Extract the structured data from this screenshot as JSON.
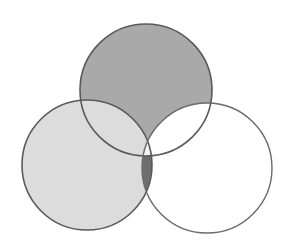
{
  "diagram": {
    "type": "venn",
    "set_count": 3,
    "background": "#ffffff",
    "stroke_color": "#5a5a5a",
    "sets": [
      {
        "id": "A",
        "position": "top",
        "cx": 146,
        "cy": 90,
        "r": 66
      },
      {
        "id": "B",
        "position": "bottom-left",
        "cx": 87,
        "cy": 165,
        "r": 65
      },
      {
        "id": "C",
        "position": "bottom-right",
        "cx": 207,
        "cy": 168,
        "r": 65
      }
    ],
    "regions": {
      "A_only": {
        "shaded": true,
        "color": "#a9a9a9"
      },
      "B_only": {
        "shaded": true,
        "color": "#dcdcdc"
      },
      "C_only": {
        "shaded": false,
        "color": "#ffffff"
      },
      "A_and_B_only": {
        "shaded": true,
        "color": "#dcdcdc"
      },
      "A_and_C_only": {
        "shaded": false,
        "color": "#ffffff"
      },
      "B_and_C_only": {
        "shaded": true,
        "color": "#6e6e6e"
      },
      "A_and_B_and_C": {
        "shaded": false,
        "color": "#f2f2f2"
      }
    }
  }
}
